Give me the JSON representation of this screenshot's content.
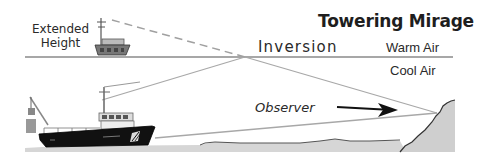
{
  "diagram": {
    "title": "Towering Mirage",
    "labels": {
      "extended_line1": "Extended",
      "extended_line2": "Height",
      "inversion": "Inversion",
      "warm_air": "Warm Air",
      "cool_air": "Cool Air",
      "observer": "Observer"
    },
    "colors": {
      "line_gray": "#9a9a9a",
      "inversion_line": "#8c8c8c",
      "ship_hull": "#111111",
      "land_fill": "#c8c8c8",
      "sea_fill": "#d4d4d4",
      "text": "#1e1e1e"
    }
  }
}
